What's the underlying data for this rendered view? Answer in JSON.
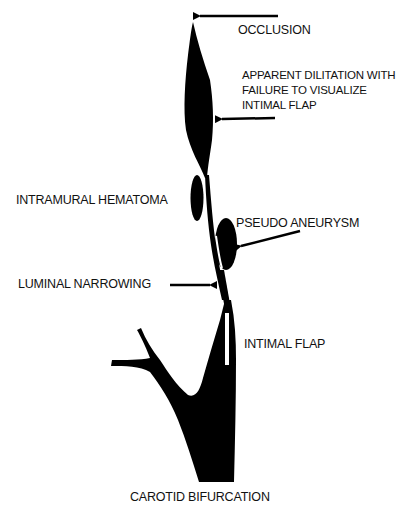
{
  "diagram": {
    "labels": {
      "occlusion": "OCCLUSION",
      "apparent_dilitation": "APPARENT DILITATION WITH FAILURE TO VISUALIZE INTIMAL FLAP",
      "intramural_hematoma": "INTRAMURAL HEMATOMA",
      "pseudo_aneurysm": "PSEUDO ANEURYSM",
      "luminal_narrowing": "LUMINAL NARROWING",
      "intimal_flap": "INTIMAL FLAP",
      "carotid_bifurcation": "CAROTID BIFURCATION"
    },
    "colors": {
      "vessel": "#000000",
      "background": "#ffffff",
      "text": "#111111"
    }
  }
}
